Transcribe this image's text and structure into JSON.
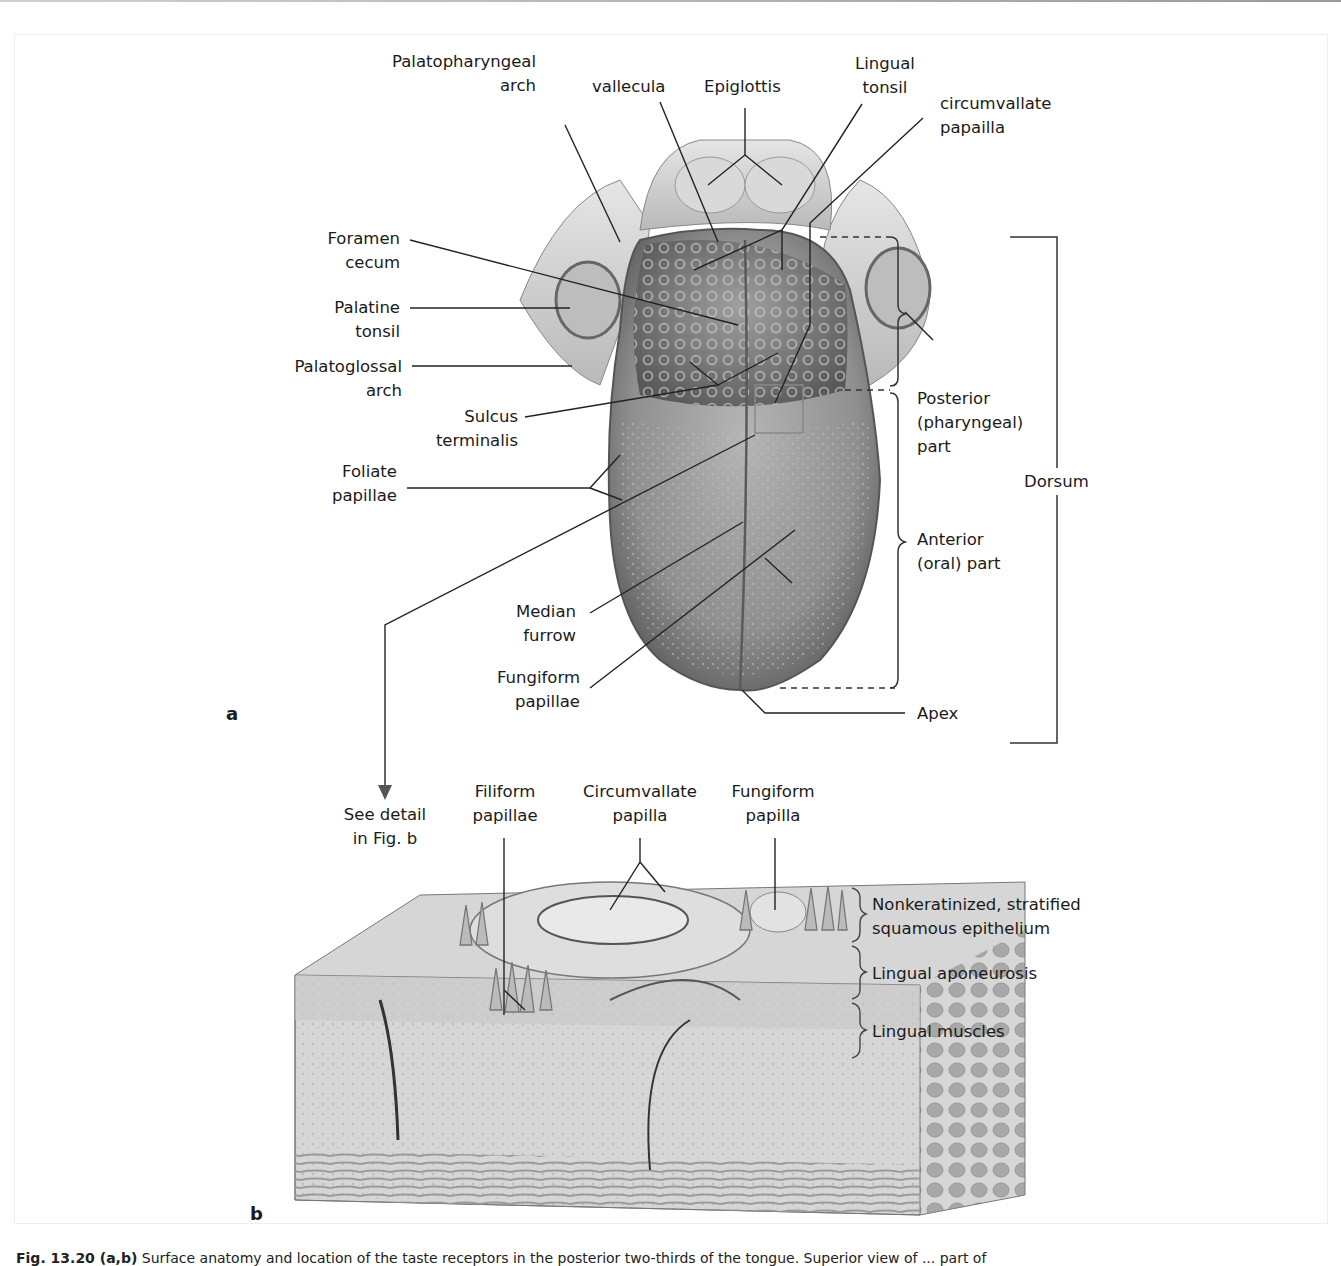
{
  "figure": {
    "panel_a": {
      "letter": "a",
      "labels": {
        "palatopharyngeal_arch": [
          "Palatopharyngeal",
          "arch"
        ],
        "vallecula": [
          "vallecula"
        ],
        "epiglottis": [
          "Epiglottis"
        ],
        "lingual_tonsil": [
          "Lingual",
          "tonsil"
        ],
        "circumvallate_papilla": [
          "circumvallate",
          "papailla"
        ],
        "foramen_cecum": [
          "Foramen",
          "cecum"
        ],
        "palatine_tonsil": [
          "Palatine",
          "tonsil"
        ],
        "palatoglossal_arch": [
          "Palatoglossal",
          "arch"
        ],
        "sulcus_terminalis": [
          "Sulcus",
          "terminalis"
        ],
        "foliate_papillae": [
          "Foliate",
          "papillae"
        ],
        "median_furrow": [
          "Median",
          "furrow"
        ],
        "fungiform_papillae": [
          "Fungiform",
          "papillae"
        ],
        "apex": [
          "Apex"
        ],
        "posterior_part": [
          "Posterior",
          "(pharyngeal)",
          "part"
        ],
        "anterior_part": [
          "Anterior",
          "(oral) part"
        ],
        "dorsum": [
          "Dorsum"
        ],
        "see_detail": [
          "See detail",
          "in Fig. b"
        ]
      }
    },
    "panel_b": {
      "letter": "b",
      "labels": {
        "filiform_papillae": [
          "Filiform",
          "papillae"
        ],
        "circumvallate_papilla": [
          "Circumvallate",
          "papilla"
        ],
        "fungiform_papilla": [
          "Fungiform",
          "papilla"
        ],
        "epithelium": [
          "Nonkeratinized, stratified",
          "squamous epithelium"
        ],
        "aponeurosis": [
          "Lingual aponeurosis"
        ],
        "muscles": [
          "Lingual muscles"
        ]
      }
    },
    "caption": {
      "number": "Fig. 13.20 (a,b)",
      "text": "Surface anatomy and location of the taste receptors in the posterior two-thirds of the tongue. Superior view of ... part of"
    },
    "colors": {
      "line": "#222222",
      "bracket": "#555555",
      "tongue_dark": "#6e6e6e",
      "tongue_mid": "#9a9a9a",
      "tongue_light": "#c8c8c8",
      "tissue_light": "#e4e4e4"
    }
  }
}
